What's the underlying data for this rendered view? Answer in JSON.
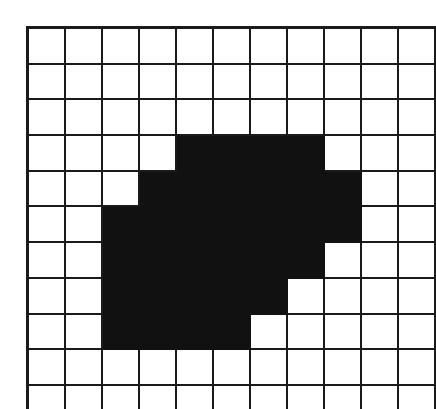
{
  "figure": {
    "kind": "binary-raster-grid",
    "title": "",
    "rows": 11,
    "cols": 11,
    "colors": {
      "filled": "#111111",
      "empty": "#ffffff",
      "gridline": "#1a1a1a",
      "background": "#ffffff"
    }
  },
  "chart_data": {
    "type": "heatmap",
    "title": "",
    "subtitle": "",
    "xlabel": "",
    "ylabel": "",
    "x": [
      1,
      2,
      3,
      4,
      5,
      6,
      7,
      8,
      9,
      10,
      11
    ],
    "y": [
      1,
      2,
      3,
      4,
      5,
      6,
      7,
      8,
      9,
      10,
      11
    ],
    "xticklabels": [],
    "yticklabels": [],
    "legend": [],
    "grid": true,
    "values": [
      [
        0,
        0,
        0,
        0,
        0,
        0,
        0,
        0,
        0,
        0,
        0
      ],
      [
        0,
        0,
        0,
        0,
        0,
        0,
        0,
        0,
        0,
        0,
        0
      ],
      [
        0,
        0,
        0,
        0,
        0,
        0,
        0,
        0,
        0,
        0,
        0
      ],
      [
        0,
        0,
        0,
        0,
        1,
        1,
        1,
        1,
        0,
        0,
        0
      ],
      [
        0,
        0,
        0,
        1,
        1,
        1,
        1,
        1,
        1,
        0,
        0
      ],
      [
        0,
        0,
        1,
        1,
        1,
        1,
        1,
        1,
        1,
        0,
        0
      ],
      [
        0,
        0,
        1,
        1,
        1,
        1,
        1,
        1,
        0,
        0,
        0
      ],
      [
        0,
        0,
        1,
        1,
        1,
        1,
        1,
        0,
        0,
        0,
        0
      ],
      [
        0,
        0,
        1,
        1,
        1,
        1,
        0,
        0,
        0,
        0,
        0
      ],
      [
        0,
        0,
        0,
        0,
        0,
        0,
        0,
        0,
        0,
        0,
        0
      ],
      [
        0,
        0,
        0,
        0,
        0,
        0,
        0,
        0,
        0,
        0,
        0
      ]
    ],
    "filled_count": 32,
    "total_cells": 121,
    "colorscale": [
      "#ffffff",
      "#111111"
    ]
  }
}
